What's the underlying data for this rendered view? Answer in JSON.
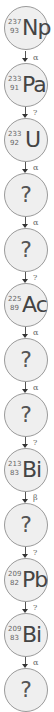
{
  "diagram": {
    "nodes": [
      {
        "known": true,
        "mass": "237",
        "atomic": "93",
        "symbol": "Np"
      },
      {
        "known": true,
        "mass": "233",
        "atomic": "91",
        "symbol": "Pa"
      },
      {
        "known": true,
        "mass": "233",
        "atomic": "92",
        "symbol": "U"
      },
      {
        "known": false,
        "label": "?"
      },
      {
        "known": false,
        "label": "?"
      },
      {
        "known": true,
        "mass": "225",
        "atomic": "89",
        "symbol": "Ac"
      },
      {
        "known": false,
        "label": "?"
      },
      {
        "known": false,
        "label": "?"
      },
      {
        "known": true,
        "mass": "213",
        "atomic": "83",
        "symbol": "Bi"
      },
      {
        "known": false,
        "label": "?"
      },
      {
        "known": true,
        "mass": "209",
        "atomic": "82",
        "symbol": "Pb"
      },
      {
        "known": true,
        "mass": "209",
        "atomic": "83",
        "symbol": "Bi"
      },
      {
        "known": false,
        "label": "?"
      }
    ],
    "decays": [
      "α",
      "?",
      "α",
      "α",
      "?",
      "α",
      "α",
      "?",
      "β",
      "?",
      "?",
      "α"
    ],
    "colors": {
      "node_fill": "#efefef",
      "node_border": "#9a9a9a",
      "text": "#444444",
      "arrow": "#333333"
    }
  }
}
